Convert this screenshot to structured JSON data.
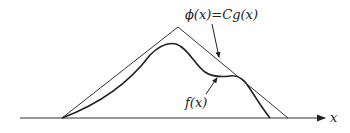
{
  "diagram": {
    "labels": {
      "envelope": "ϕ(x)=Cg(x)",
      "density": "f(x)",
      "axis": "x"
    },
    "colors": {
      "line": "#222222",
      "background": "#ffffff"
    }
  }
}
